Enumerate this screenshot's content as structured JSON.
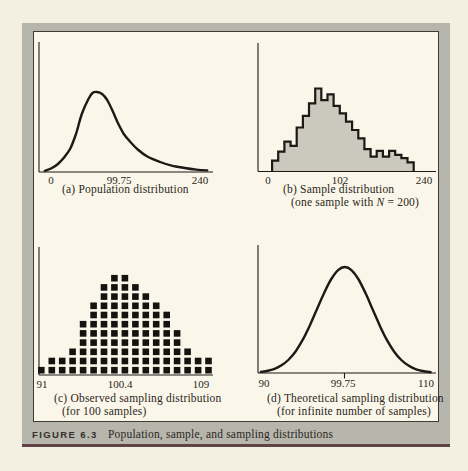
{
  "figure": {
    "label": "FIGURE 6.3",
    "caption": "Population, sample, and sampling distributions"
  },
  "panels": {
    "a": {
      "caption": "(a) Population distribution",
      "x_ticks": [
        "0",
        "99.75",
        "240"
      ]
    },
    "b": {
      "caption_line1": "(b) Sample distribution",
      "caption_line2_pre": "(one sample with ",
      "caption_line2_var": "N",
      "caption_line2_post": " = 200)",
      "x_ticks": [
        "0",
        "102",
        "240"
      ]
    },
    "c": {
      "caption_line1": "(c) Observed sampling distribution",
      "caption_line2": "(for 100 samples)",
      "x_ticks": [
        "91",
        "100.4",
        "109"
      ]
    },
    "d": {
      "caption_line1": "(d) Theoretical sampling distribution",
      "caption_line2": "(for infinite number of samples)",
      "x_ticks": [
        "90",
        "99.75",
        "110"
      ]
    }
  },
  "chart_data": [
    {
      "panel": "a",
      "type": "line",
      "title": "Population distribution",
      "x_range": [
        0,
        240
      ],
      "x_tick_labels": [
        "0",
        "99.75",
        "240"
      ],
      "grid": false,
      "curve": {
        "x": [
          8,
          18,
          26,
          34,
          43,
          51,
          59,
          68,
          74,
          80,
          87,
          94,
          101,
          109,
          117,
          126,
          137,
          150,
          167,
          183,
          201,
          217,
          232
        ],
        "y_rel": [
          0.012,
          0.05,
          0.1,
          0.175,
          0.29,
          0.475,
          0.725,
          0.91,
          0.99,
          1.0,
          0.975,
          0.9,
          0.775,
          0.61,
          0.475,
          0.375,
          0.275,
          0.19,
          0.125,
          0.08,
          0.05,
          0.03,
          0.02
        ]
      }
    },
    {
      "panel": "b",
      "type": "bar",
      "title": "Sample distribution (one sample with N = 200)",
      "x_range": [
        0,
        240
      ],
      "x_tick_labels": [
        "0",
        "102",
        "240"
      ],
      "grid": false,
      "histogram": {
        "bins_start": 19,
        "bin_width": 8.3,
        "heights_rel": [
          0.13,
          0.24,
          0.36,
          0.31,
          0.53,
          0.67,
          0.82,
          1.0,
          0.86,
          0.93,
          0.79,
          0.7,
          0.6,
          0.5,
          0.4,
          0.27,
          0.18,
          0.25,
          0.18,
          0.25,
          0.2,
          0.16,
          0.11
        ]
      }
    },
    {
      "panel": "c",
      "type": "scatter",
      "title": "Observed sampling distribution (for 100 samples)",
      "x_range": [
        91,
        109
      ],
      "x_tick_labels": [
        "91",
        "100.4",
        "109"
      ],
      "grid": false,
      "dotplot": {
        "total_points": 100,
        "column_counts": [
          1,
          2,
          2,
          3,
          6,
          8,
          10,
          11,
          11,
          10,
          9,
          8,
          7,
          5,
          3,
          2,
          2
        ]
      }
    },
    {
      "panel": "d",
      "type": "line",
      "title": "Theoretical sampling distribution (for infinite number of samples)",
      "x_range": [
        90,
        110
      ],
      "x_tick_labels": [
        "90",
        "99.75",
        "110"
      ],
      "mean_label": "99.75",
      "grid": false,
      "curve": {
        "x": [
          90.3,
          91,
          91.8,
          92.6,
          93.4,
          94.2,
          95,
          95.8,
          96.6,
          97.4,
          98.2,
          99,
          99.75,
          100.5,
          101.3,
          102.1,
          102.9,
          103.7,
          104.5,
          105.3,
          106.1,
          106.9,
          107.7,
          108.5,
          109.4
        ],
        "y_rel": [
          0.01,
          0.019,
          0.037,
          0.07,
          0.123,
          0.201,
          0.309,
          0.444,
          0.597,
          0.75,
          0.882,
          0.971,
          1.0,
          0.971,
          0.882,
          0.75,
          0.597,
          0.444,
          0.309,
          0.201,
          0.123,
          0.07,
          0.037,
          0.019,
          0.008
        ]
      }
    }
  ],
  "colors": {
    "page_background": "#f3efe1",
    "frame_gray": "#b7b6ad",
    "panel_background": "#faf7ea",
    "panel_border": "#3f3c35",
    "bottom_rule_maroon": "#5f4349",
    "histogram_fill": "#cbc9bd",
    "ink": "#1c1916"
  }
}
